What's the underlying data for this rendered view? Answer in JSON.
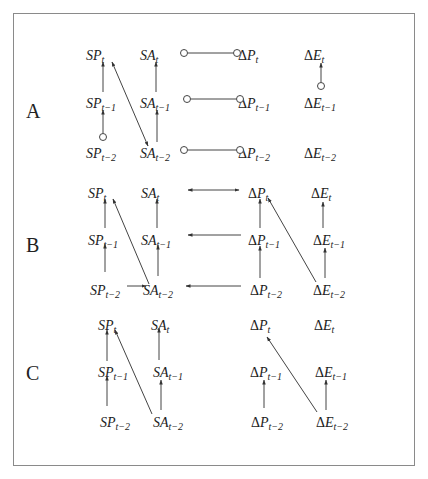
{
  "diagram": {
    "title": "",
    "panels": [
      {
        "label": "A",
        "label_pos": [
          26,
          118
        ],
        "rows_y": [
          55,
          103,
          153
        ],
        "nodes": [
          {
            "id": "SP_t",
            "prefix": "",
            "var": "SP",
            "sub": "t",
            "x": 86,
            "row": 0
          },
          {
            "id": "SP_t1",
            "prefix": "",
            "var": "SP",
            "sub": "t−1",
            "x": 86,
            "row": 1
          },
          {
            "id": "SP_t2",
            "prefix": "",
            "var": "SP",
            "sub": "t−2",
            "x": 86,
            "row": 2
          },
          {
            "id": "SA_t",
            "prefix": "",
            "var": "SA",
            "sub": "t",
            "x": 140,
            "row": 0
          },
          {
            "id": "SA_t1",
            "prefix": "",
            "var": "SA",
            "sub": "t−1",
            "x": 140,
            "row": 1
          },
          {
            "id": "SA_t2",
            "prefix": "",
            "var": "SA",
            "sub": "t−2",
            "x": 140,
            "row": 2
          },
          {
            "id": "DP_t",
            "prefix": "Δ",
            "var": "P",
            "sub": "t",
            "x": 238,
            "row": 0
          },
          {
            "id": "DP_t1",
            "prefix": "Δ",
            "var": "P",
            "sub": "t−1",
            "x": 238,
            "row": 1
          },
          {
            "id": "DP_t2",
            "prefix": "Δ",
            "var": "P",
            "sub": "t−2",
            "x": 238,
            "row": 2
          },
          {
            "id": "DE_t",
            "prefix": "Δ",
            "var": "E",
            "sub": "t",
            "x": 304,
            "row": 0
          },
          {
            "id": "DE_t1",
            "prefix": "Δ",
            "var": "E",
            "sub": "t−1",
            "x": 304,
            "row": 1
          },
          {
            "id": "DE_t2",
            "prefix": "Δ",
            "var": "E",
            "sub": "t−2",
            "x": 304,
            "row": 2
          }
        ],
        "edges": [
          {
            "type": "arrow",
            "x1": 103,
            "y1": 92,
            "x2": 103,
            "y2": 62,
            "start": "none",
            "end": "arrow"
          },
          {
            "type": "arrow",
            "x1": 103,
            "y1": 137,
            "x2": 103,
            "y2": 110,
            "start": "circle",
            "end": "arrow"
          },
          {
            "type": "arrow",
            "x1": 156,
            "y1": 92,
            "x2": 156,
            "y2": 62,
            "start": "none",
            "end": "arrow"
          },
          {
            "type": "arrow",
            "x1": 157,
            "y1": 142,
            "x2": 157,
            "y2": 110,
            "start": "none",
            "end": "arrow"
          },
          {
            "type": "arrow",
            "x1": 112,
            "y1": 62,
            "x2": 148,
            "y2": 146,
            "start": "arrow",
            "end": "arrow"
          },
          {
            "type": "line",
            "x1": 184,
            "y1": 53,
            "x2": 237,
            "y2": 53,
            "start": "circle",
            "end": "circle"
          },
          {
            "type": "line",
            "x1": 187,
            "y1": 99,
            "x2": 240,
            "y2": 99,
            "start": "circle",
            "end": "circle"
          },
          {
            "type": "line",
            "x1": 184,
            "y1": 150,
            "x2": 240,
            "y2": 150,
            "start": "circle",
            "end": "circle"
          },
          {
            "type": "arrow",
            "x1": 321,
            "y1": 86,
            "x2": 321,
            "y2": 63,
            "start": "circle",
            "end": "arrow"
          }
        ]
      },
      {
        "label": "B",
        "label_pos": [
          26,
          252
        ],
        "rows_y": [
          193,
          240,
          290
        ],
        "nodes": [
          {
            "id": "SP_t",
            "prefix": "",
            "var": "SP",
            "sub": "t",
            "x": 88,
            "row": 0
          },
          {
            "id": "SP_t1",
            "prefix": "",
            "var": "SP",
            "sub": "t−1",
            "x": 88,
            "row": 1
          },
          {
            "id": "SP_t2",
            "prefix": "",
            "var": "SP",
            "sub": "t−2",
            "x": 90,
            "row": 2
          },
          {
            "id": "SA_t",
            "prefix": "",
            "var": "SA",
            "sub": "t",
            "x": 141,
            "row": 0
          },
          {
            "id": "SA_t1",
            "prefix": "",
            "var": "SA",
            "sub": "t−1",
            "x": 141,
            "row": 1
          },
          {
            "id": "SA_t2",
            "prefix": "",
            "var": "SA",
            "sub": "t−2",
            "x": 143,
            "row": 2
          },
          {
            "id": "DP_t",
            "prefix": "Δ",
            "var": "P",
            "sub": "t",
            "x": 248,
            "row": 0
          },
          {
            "id": "DP_t1",
            "prefix": "Δ",
            "var": "P",
            "sub": "t−1",
            "x": 248,
            "row": 1
          },
          {
            "id": "DP_t2",
            "prefix": "Δ",
            "var": "P",
            "sub": "t−2",
            "x": 250,
            "row": 2
          },
          {
            "id": "DE_t",
            "prefix": "Δ",
            "var": "E",
            "sub": "t",
            "x": 311,
            "row": 0
          },
          {
            "id": "DE_t1",
            "prefix": "Δ",
            "var": "E",
            "sub": "t−1",
            "x": 313,
            "row": 1
          },
          {
            "id": "DE_t2",
            "prefix": "Δ",
            "var": "E",
            "sub": "t−2",
            "x": 313,
            "row": 2
          }
        ],
        "edges": [
          {
            "type": "arrow",
            "x1": 105,
            "y1": 228,
            "x2": 105,
            "y2": 199,
            "start": "none",
            "end": "arrow"
          },
          {
            "type": "arrow",
            "x1": 105,
            "y1": 272,
            "x2": 105,
            "y2": 244,
            "start": "none",
            "end": "arrow"
          },
          {
            "type": "arrow",
            "x1": 157,
            "y1": 228,
            "x2": 157,
            "y2": 199,
            "start": "none",
            "end": "arrow"
          },
          {
            "type": "arrow",
            "x1": 158,
            "y1": 276,
            "x2": 158,
            "y2": 245,
            "start": "none",
            "end": "arrow"
          },
          {
            "type": "arrow",
            "x1": 149,
            "y1": 284,
            "x2": 113,
            "y2": 199,
            "start": "none",
            "end": "arrow"
          },
          {
            "type": "arrow",
            "x1": 127,
            "y1": 286,
            "x2": 146,
            "y2": 286,
            "start": "none",
            "end": "arrow"
          },
          {
            "type": "arrow",
            "x1": 188,
            "y1": 190,
            "x2": 239,
            "y2": 190,
            "start": "arrow",
            "end": "arrow"
          },
          {
            "type": "arrow",
            "x1": 241,
            "y1": 235,
            "x2": 188,
            "y2": 235,
            "start": "none",
            "end": "arrow"
          },
          {
            "type": "arrow",
            "x1": 241,
            "y1": 286,
            "x2": 186,
            "y2": 286,
            "start": "none",
            "end": "arrow"
          },
          {
            "type": "arrow",
            "x1": 260,
            "y1": 228,
            "x2": 260,
            "y2": 199,
            "start": "none",
            "end": "arrow"
          },
          {
            "type": "arrow",
            "x1": 260,
            "y1": 278,
            "x2": 260,
            "y2": 246,
            "start": "none",
            "end": "arrow"
          },
          {
            "type": "arrow",
            "x1": 323,
            "y1": 228,
            "x2": 323,
            "y2": 202,
            "start": "none",
            "end": "arrow"
          },
          {
            "type": "arrow",
            "x1": 325,
            "y1": 278,
            "x2": 325,
            "y2": 248,
            "start": "none",
            "end": "arrow"
          },
          {
            "type": "arrow",
            "x1": 316,
            "y1": 282,
            "x2": 268,
            "y2": 198,
            "start": "none",
            "end": "arrow"
          }
        ]
      },
      {
        "label": "C",
        "label_pos": [
          26,
          380
        ],
        "rows_y": [
          325,
          372,
          422
        ],
        "nodes": [
          {
            "id": "SP_t",
            "prefix": "",
            "var": "SP",
            "sub": "t",
            "x": 98,
            "row": 0
          },
          {
            "id": "SP_t1",
            "prefix": "",
            "var": "SP",
            "sub": "t−1",
            "x": 98,
            "row": 1
          },
          {
            "id": "SP_t2",
            "prefix": "",
            "var": "SP",
            "sub": "t−2",
            "x": 100,
            "row": 2
          },
          {
            "id": "SA_t",
            "prefix": "",
            "var": "SA",
            "sub": "t",
            "x": 151,
            "row": 0
          },
          {
            "id": "SA_t1",
            "prefix": "",
            "var": "SA",
            "sub": "t−1",
            "x": 153,
            "row": 1
          },
          {
            "id": "SA_t2",
            "prefix": "",
            "var": "SA",
            "sub": "t−2",
            "x": 153,
            "row": 2
          },
          {
            "id": "DP_t",
            "prefix": "Δ",
            "var": "P",
            "sub": "t",
            "x": 250,
            "row": 0
          },
          {
            "id": "DP_t1",
            "prefix": "Δ",
            "var": "P",
            "sub": "t−1",
            "x": 250,
            "row": 1
          },
          {
            "id": "DP_t2",
            "prefix": "Δ",
            "var": "P",
            "sub": "t−2",
            "x": 251,
            "row": 2
          },
          {
            "id": "DE_t",
            "prefix": "Δ",
            "var": "E",
            "sub": "t",
            "x": 314,
            "row": 0
          },
          {
            "id": "DE_t1",
            "prefix": "Δ",
            "var": "E",
            "sub": "t−1",
            "x": 315,
            "row": 1
          },
          {
            "id": "DE_t2",
            "prefix": "Δ",
            "var": "E",
            "sub": "t−2",
            "x": 316,
            "row": 2
          }
        ],
        "edges": [
          {
            "type": "arrow",
            "x1": 107,
            "y1": 361,
            "x2": 107,
            "y2": 330,
            "start": "none",
            "end": "arrow"
          },
          {
            "type": "arrow",
            "x1": 107,
            "y1": 406,
            "x2": 107,
            "y2": 376,
            "start": "none",
            "end": "arrow"
          },
          {
            "type": "arrow",
            "x1": 159,
            "y1": 360,
            "x2": 159,
            "y2": 328,
            "start": "none",
            "end": "arrow"
          },
          {
            "type": "arrow",
            "x1": 161,
            "y1": 410,
            "x2": 161,
            "y2": 380,
            "start": "none",
            "end": "arrow"
          },
          {
            "type": "arrow",
            "x1": 152,
            "y1": 414,
            "x2": 115,
            "y2": 330,
            "start": "none",
            "end": "arrow"
          },
          {
            "type": "arrow",
            "x1": 264,
            "y1": 408,
            "x2": 264,
            "y2": 380,
            "start": "none",
            "end": "arrow"
          },
          {
            "type": "arrow",
            "x1": 326,
            "y1": 410,
            "x2": 326,
            "y2": 380,
            "start": "none",
            "end": "arrow"
          },
          {
            "type": "arrow",
            "x1": 317,
            "y1": 412,
            "x2": 267,
            "y2": 337,
            "start": "none",
            "end": "arrow"
          }
        ]
      }
    ]
  },
  "legend_note": "Circle endpoints denote undirected/ambiguous edge marks; arrowheads denote directed edges."
}
